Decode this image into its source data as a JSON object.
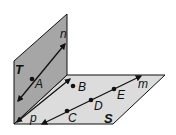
{
  "figure": {
    "colors": {
      "plane_T": "#a6a6a6",
      "plane_S": "#dcdcdc",
      "stroke": "#111111",
      "background": "#ffffff"
    },
    "planes": [
      {
        "name": "T",
        "label": "T"
      },
      {
        "name": "S",
        "label": "S"
      }
    ],
    "lines": [
      {
        "name": "n",
        "label": "n"
      },
      {
        "name": "p",
        "label": "p"
      },
      {
        "name": "m",
        "label": "m"
      }
    ],
    "points": [
      {
        "name": "A",
        "label": "A"
      },
      {
        "name": "B",
        "label": "B"
      },
      {
        "name": "C",
        "label": "C"
      },
      {
        "name": "D",
        "label": "D"
      },
      {
        "name": "E",
        "label": "E"
      }
    ]
  }
}
